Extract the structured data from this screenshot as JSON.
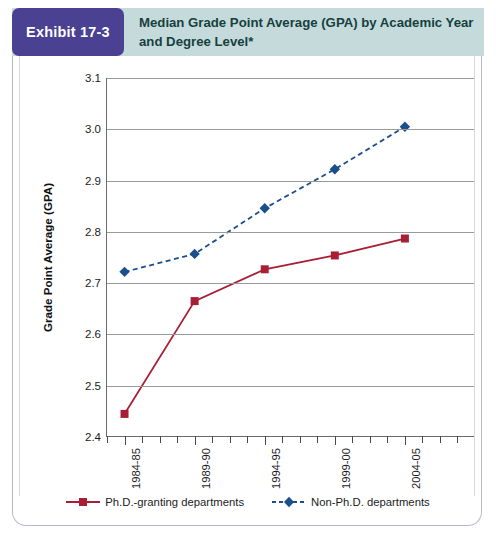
{
  "header": {
    "badge_label": "Exhibit 17-3",
    "title": "Median Grade Point Average (GPA) by Academic Year and Degree Level*",
    "badge_color": "#4a4192",
    "band_color": "#c5dbdb",
    "title_color": "#17403f"
  },
  "chart_data": {
    "type": "line",
    "title": "Median Grade Point Average (GPA) by Academic Year and Degree Level*",
    "xlabel": "",
    "ylabel": "Grade Point Average (GPA)",
    "categories": [
      "1984-85",
      "1989-90",
      "1994-95",
      "1999-00",
      "2004-05"
    ],
    "ylim": [
      2.4,
      3.1
    ],
    "yticks": [
      "2.4",
      "2.5",
      "2.6",
      "2.7",
      "2.8",
      "2.9",
      "3.0",
      "3.1"
    ],
    "grid": true,
    "legend_position": "bottom",
    "series": [
      {
        "name": "Ph.D.-granting departments",
        "values": [
          2.445,
          2.665,
          2.727,
          2.754,
          2.787
        ],
        "color": "#a81f35",
        "marker": "square",
        "linestyle": "solid"
      },
      {
        "name": "Non-Ph.D. departments",
        "values": [
          2.722,
          2.757,
          2.846,
          2.922,
          3.005
        ],
        "color": "#1b4f8c",
        "marker": "diamond",
        "linestyle": "dashed"
      }
    ]
  }
}
